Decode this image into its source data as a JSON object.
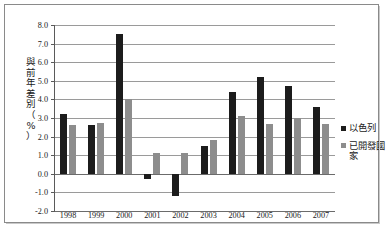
{
  "chart_data": {
    "type": "bar",
    "title": "",
    "xlabel": "",
    "ylabel": "與前年差別（%）",
    "ylabel_chars": [
      "與",
      "前",
      "年",
      "差",
      "別",
      "（",
      "%",
      "）"
    ],
    "categories": [
      "1998",
      "1999",
      "2000",
      "2001",
      "2002",
      "2003",
      "2004",
      "2005",
      "2006",
      "2007"
    ],
    "series": [
      {
        "name": "以色列",
        "color": "#1c1c1c",
        "values": [
          3.2,
          2.6,
          7.5,
          -0.3,
          -1.2,
          1.5,
          4.4,
          5.2,
          4.7,
          3.6
        ]
      },
      {
        "name": "已開發國家",
        "color": "#8d8d8d",
        "values": [
          2.6,
          2.75,
          4.0,
          1.1,
          1.1,
          1.8,
          3.1,
          2.7,
          3.0,
          2.7
        ]
      }
    ],
    "ylim": [
      -2.0,
      8.0
    ],
    "yticks": [
      "8.0",
      "7.0",
      "6.0",
      "5.0",
      "4.0",
      "3.0",
      "2.0",
      "1.0",
      "0.0",
      "-1.0",
      "-2.0"
    ],
    "ytick_values": [
      8.0,
      7.0,
      6.0,
      5.0,
      4.0,
      3.0,
      2.0,
      1.0,
      0.0,
      -1.0,
      -2.0
    ],
    "grid": true,
    "legend_position": "right"
  },
  "legend": {
    "items": [
      {
        "label": "以色列",
        "color": "#1c1c1c"
      },
      {
        "label": "已開發國家",
        "color": "#8d8d8d"
      }
    ]
  }
}
